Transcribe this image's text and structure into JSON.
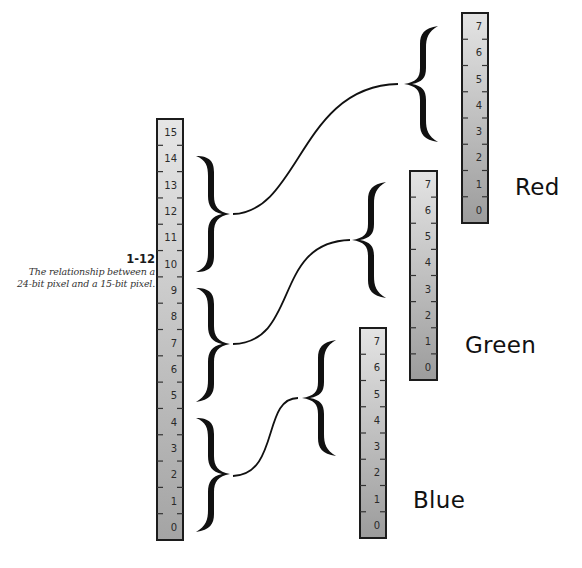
{
  "figure": {
    "number": "1-12",
    "caption_line1": "The relationship between a",
    "caption_line2": "24-bit pixel and a 15-bit pixel."
  },
  "pixel15": {
    "name": "15-bit pixel",
    "bits": [
      "15",
      "14",
      "13",
      "12",
      "11",
      "10",
      "9",
      "8",
      "7",
      "6",
      "5",
      "4",
      "3",
      "2",
      "1",
      "0"
    ],
    "rect": {
      "x": 157,
      "y": 119,
      "w": 26,
      "h": 421
    }
  },
  "channels": [
    {
      "name": "Red",
      "label": "Red",
      "bits": [
        "7",
        "6",
        "5",
        "4",
        "3",
        "2",
        "1",
        "0"
      ],
      "rect": {
        "x": 462,
        "y": 13,
        "w": 26,
        "h": 210
      },
      "label_pos": {
        "x": 515,
        "y": 174
      }
    },
    {
      "name": "Green",
      "label": "Green",
      "bits": [
        "7",
        "6",
        "5",
        "4",
        "3",
        "2",
        "1",
        "0"
      ],
      "rect": {
        "x": 410,
        "y": 171,
        "w": 27,
        "h": 209
      },
      "label_pos": {
        "x": 465,
        "y": 332
      }
    },
    {
      "name": "Blue",
      "label": "Blue",
      "bits": [
        "7",
        "6",
        "5",
        "4",
        "3",
        "2",
        "1",
        "0"
      ],
      "rect": {
        "x": 360,
        "y": 328,
        "w": 26,
        "h": 210
      },
      "label_pos": {
        "x": 413,
        "y": 487
      }
    }
  ],
  "mapping": [
    {
      "source_bits": "14-10",
      "target": "Red",
      "target_bits": "7-3"
    },
    {
      "source_bits": "9-5",
      "target": "Green",
      "target_bits": "7-3"
    },
    {
      "source_bits": "4-0",
      "target": "Blue",
      "target_bits": "7-3"
    }
  ],
  "colors": {
    "bar_top": "#e4e4e4",
    "bar_bottom": "#9a9a9a",
    "bar_border": "#1c1c1c",
    "ink": "#111111"
  }
}
